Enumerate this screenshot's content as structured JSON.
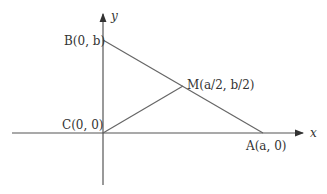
{
  "diagram": {
    "axes": {
      "x_label": "x",
      "y_label": "y"
    },
    "points": {
      "B": {
        "name": "B",
        "coords": "(0, b)"
      },
      "C": {
        "name": "C",
        "coords": "(0, 0)"
      },
      "M": {
        "name": "M",
        "coords": "(a/2, b/2)"
      },
      "A": {
        "name": "A",
        "coords": "(a, 0)"
      }
    },
    "labels": {
      "B": "B(0, b)",
      "C": "C(0, 0)",
      "M": "M(a/2, b/2)",
      "A": "A(a, 0)"
    },
    "colors": {
      "line": "#555555",
      "text": "#333333",
      "background": "#ffffff"
    }
  }
}
